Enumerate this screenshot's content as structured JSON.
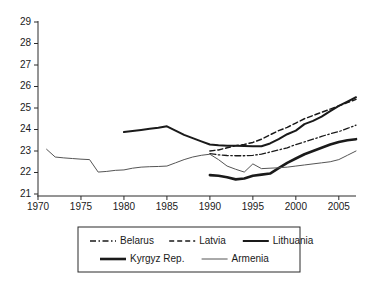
{
  "chart_data": {
    "type": "line",
    "title": "",
    "xlabel": "",
    "ylabel": "",
    "xlim": [
      1970,
      2007
    ],
    "ylim": [
      21,
      29
    ],
    "grid": false,
    "legend_position": "bottom",
    "x_ticks": [
      1970,
      1975,
      1980,
      1985,
      1990,
      1995,
      2000,
      2005
    ],
    "y_ticks": [
      21,
      22,
      23,
      24,
      25,
      26,
      27,
      28,
      29
    ],
    "series": [
      {
        "name": "Belarus",
        "style": "dash-dot",
        "color": "#1a1a1a",
        "width": 1.3,
        "x": [
          1990,
          1991,
          1992,
          1993,
          1994,
          1995,
          1996,
          1997,
          1998,
          1999,
          2000,
          2001,
          2002,
          2003,
          2004,
          2005,
          2006,
          2007
        ],
        "values": [
          22.88,
          22.82,
          22.79,
          22.78,
          22.78,
          22.8,
          22.85,
          22.95,
          23.05,
          23.15,
          23.3,
          23.42,
          23.55,
          23.68,
          23.8,
          23.9,
          24.05,
          24.2
        ]
      },
      {
        "name": "Latvia",
        "style": "dashed",
        "color": "#1a1a1a",
        "width": 1.5,
        "x": [
          1990,
          1991,
          1992,
          1993,
          1994,
          1995,
          1996,
          1997,
          1998,
          1999,
          2000,
          2001,
          2002,
          2003,
          2004,
          2005,
          2006,
          2007
        ],
        "values": [
          23.0,
          23.05,
          23.15,
          23.25,
          23.3,
          23.4,
          23.55,
          23.75,
          23.95,
          24.1,
          24.3,
          24.5,
          24.65,
          24.8,
          24.95,
          25.1,
          25.25,
          25.4
        ]
      },
      {
        "name": "Lithuania",
        "style": "solid",
        "color": "#1a1a1a",
        "width": 2.0,
        "x": [
          1980,
          1981,
          1982,
          1983,
          1984,
          1985,
          1986,
          1987,
          1988,
          1989,
          1990,
          1991,
          1992,
          1993,
          1994,
          1995,
          1996,
          1997,
          1998,
          1999,
          2000,
          2001,
          2002,
          2003,
          2004,
          2005,
          2006,
          2007
        ],
        "values": [
          23.88,
          23.93,
          23.98,
          24.03,
          24.08,
          24.15,
          23.95,
          23.75,
          23.6,
          23.45,
          23.3,
          23.27,
          23.25,
          23.24,
          23.23,
          23.22,
          23.22,
          23.35,
          23.55,
          23.78,
          23.95,
          24.25,
          24.4,
          24.6,
          24.85,
          25.1,
          25.3,
          25.5
        ]
      },
      {
        "name": "Kyrgyz Rep.",
        "style": "solid",
        "color": "#1a1a1a",
        "width": 2.6,
        "x": [
          1990,
          1991,
          1992,
          1993,
          1994,
          1995,
          1996,
          1997,
          1998,
          1999,
          2000,
          2001,
          2002,
          2003,
          2004,
          2005,
          2006,
          2007
        ],
        "values": [
          21.88,
          21.85,
          21.78,
          21.68,
          21.72,
          21.85,
          21.9,
          21.95,
          22.2,
          22.45,
          22.65,
          22.85,
          23.0,
          23.15,
          23.3,
          23.42,
          23.5,
          23.55
        ]
      },
      {
        "name": "Armenia",
        "style": "solid",
        "color": "#555555",
        "width": 1.0,
        "x": [
          1971,
          1972,
          1973,
          1974,
          1975,
          1976,
          1977,
          1978,
          1979,
          1980,
          1981,
          1982,
          1983,
          1984,
          1985,
          1986,
          1987,
          1988,
          1989,
          1990,
          1991,
          1992,
          1993,
          1994,
          1995,
          1996,
          1997,
          1998,
          1999,
          2000,
          2001,
          2002,
          2003,
          2004,
          2005,
          2006,
          2007
        ],
        "values": [
          23.08,
          22.72,
          22.68,
          22.65,
          22.62,
          22.6,
          22.02,
          22.05,
          22.1,
          22.12,
          22.2,
          22.25,
          22.27,
          22.28,
          22.3,
          22.45,
          22.6,
          22.72,
          22.8,
          22.85,
          22.6,
          22.3,
          22.15,
          22.02,
          22.4,
          22.18,
          22.2,
          22.22,
          22.25,
          22.3,
          22.35,
          22.4,
          22.45,
          22.5,
          22.6,
          22.8,
          23.0
        ]
      }
    ]
  },
  "legend": {
    "rows": [
      [
        {
          "label": "Belarus",
          "style": "dash-dot"
        },
        {
          "label": "Latvia",
          "style": "dashed"
        },
        {
          "label": "Lithuania",
          "style": "solid-medium"
        }
      ],
      [
        {
          "label": "Kyrgyz Rep.",
          "style": "solid-thick"
        },
        {
          "label": "Armenia",
          "style": "solid-thin"
        }
      ]
    ]
  }
}
